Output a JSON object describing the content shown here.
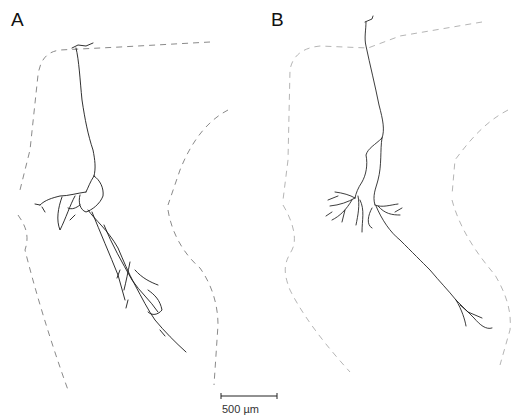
{
  "figure": {
    "panels": [
      {
        "id": "A",
        "label": "A",
        "content": "traced neuron with boundary contours (dashed)"
      },
      {
        "id": "B",
        "label": "B",
        "content": "traced neuron with boundary contours (dashed)"
      }
    ],
    "scale_bar": {
      "label": "500 µm",
      "length_px": 56
    },
    "colors": {
      "neuron_trace": "#1a1a1a",
      "contour_panel_a": "#8a8a8a",
      "contour_panel_b": "#b5b5b5",
      "background": "#ffffff"
    }
  }
}
